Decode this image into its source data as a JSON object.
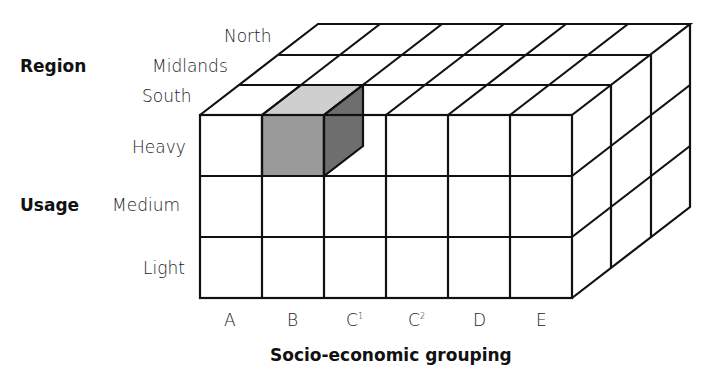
{
  "axes": {
    "region": {
      "title": "Region",
      "levels": [
        "North",
        "Midlands",
        "South"
      ]
    },
    "usage": {
      "title": "Usage",
      "levels": [
        "Heavy",
        "Medium",
        "Light"
      ]
    },
    "socio": {
      "title": "Socio-economic grouping",
      "levels": [
        "A",
        "B",
        "C",
        "1",
        "C",
        "2",
        "D",
        "E"
      ]
    }
  },
  "highlighted_cell": {
    "region": "South",
    "usage": "Heavy",
    "group": "B"
  },
  "colors": {
    "front": "#9a9a9a",
    "top": "#cfcfcf",
    "side": "#6e6e6e",
    "line": "#111111"
  }
}
